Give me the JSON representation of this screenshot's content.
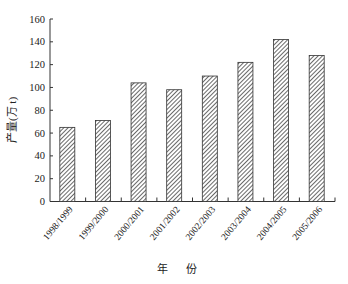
{
  "chart_data": {
    "type": "bar",
    "title": "",
    "xlabel": "年 份",
    "ylabel": "产量(万 t)",
    "categories": [
      "1998/1999",
      "1999/2000",
      "2000/2001",
      "2001/2002",
      "2002/2003",
      "2003/2004",
      "2004/2005",
      "2005/2006"
    ],
    "values": [
      65,
      71,
      104,
      98,
      110,
      122,
      142,
      128
    ],
    "ylim": [
      0,
      160
    ],
    "yticks": [
      0,
      20,
      40,
      60,
      80,
      100,
      120,
      140,
      160
    ],
    "grid": false,
    "legend": null,
    "bar_fill": "diagonal-hatch",
    "colors": {
      "bar_stroke": "#333333",
      "hatch": "#444444",
      "axis": "#333333"
    }
  }
}
